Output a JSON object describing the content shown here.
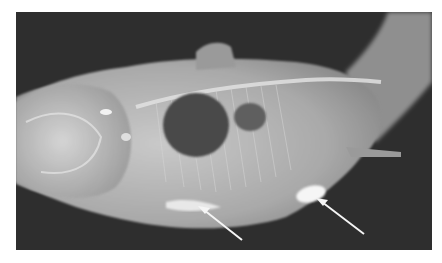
{
  "image": {
    "subject": "radiograph of fish (lateral view)",
    "background_color": "#2e2e2e",
    "border_color": "#ffffff",
    "annotations": [
      {
        "type": "arrow",
        "color": "#ffffff",
        "points_to": "ventral radiopaque region (mid)"
      },
      {
        "type": "arrow",
        "color": "#ffffff",
        "points_to": "bright oval radiopaque body (posterior)"
      }
    ]
  }
}
